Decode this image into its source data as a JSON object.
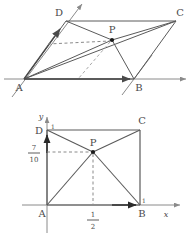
{
  "document": {
    "title": "Parallelogram and unit-square vector figures",
    "figure_count": 2
  },
  "upper_figure": {
    "name": "parallelogram-ABCD-with-interior-point-P",
    "shape": "parallelogram",
    "vertices": [
      {
        "id": "A",
        "label": "A",
        "x": 24,
        "y": 79
      },
      {
        "id": "B",
        "label": "B",
        "x": 134,
        "y": 79
      },
      {
        "id": "C",
        "label": "C",
        "x": 176,
        "y": 21
      },
      {
        "id": "D",
        "label": "D",
        "x": 66,
        "y": 21
      }
    ],
    "interior_point": {
      "id": "P",
      "label": "P",
      "x": 112,
      "y": 40
    },
    "axis_arrow_labels": [
      "A",
      "B"
    ],
    "vector_arrows": [
      {
        "name": "AB-vector-arrow",
        "from": "A",
        "to": "B"
      },
      {
        "name": "AD-vector-arrow",
        "from": "A",
        "to": "D"
      }
    ],
    "dashed_lines": [
      {
        "name": "horizontal-projection-dashed",
        "from": "AD-edge",
        "to": "P"
      },
      {
        "name": "oblique-projection-dashed",
        "from": "P",
        "to": "AB-edge"
      }
    ],
    "solid_segments": [
      "AB",
      "BC",
      "CD",
      "DA",
      "AP",
      "AC",
      "DP",
      "PB",
      "PC"
    ]
  },
  "lower_figure": {
    "name": "unit-square-ABCD-coordinate-plane",
    "shape": "square",
    "axes": {
      "x_label": "x",
      "y_label": "y",
      "origin_at": "A"
    },
    "vertices": [
      {
        "id": "A",
        "label": "A",
        "coord": [
          0,
          0
        ]
      },
      {
        "id": "B",
        "label": "B",
        "coord": [
          1,
          0
        ]
      },
      {
        "id": "C",
        "label": "C",
        "coord": [
          1,
          1
        ]
      },
      {
        "id": "D",
        "label": "D",
        "coord": [
          0,
          1
        ]
      }
    ],
    "interior_point": {
      "id": "P",
      "label": "P",
      "coord": [
        0.5,
        0.7
      ]
    },
    "tick_labels": [
      {
        "name": "y-tick-one",
        "text": "1",
        "axis": "y",
        "value": 1
      },
      {
        "name": "x-tick-one",
        "text": "1",
        "axis": "x",
        "value": 1
      }
    ],
    "fraction_labels": [
      {
        "name": "y-value-seven-tenths",
        "numerator": "7",
        "denominator": "10",
        "axis": "y",
        "value": 0.7
      },
      {
        "name": "x-value-one-half",
        "numerator": "1",
        "denominator": "2",
        "axis": "x",
        "value": 0.5
      }
    ],
    "dashed_lines": [
      {
        "name": "p-to-y-axis-dashed",
        "from": "P",
        "to": "y-axis"
      },
      {
        "name": "p-to-x-axis-dashed",
        "from": "P",
        "to": "x-axis"
      }
    ],
    "solid_segments": [
      "AB",
      "BC",
      "CD",
      "DA",
      "DP",
      "PC",
      "AP",
      "PB"
    ],
    "arrow_markers": [
      "y-axis-arrow-at-D",
      "x-axis-arrow-at-B",
      "x-axis-tip-arrow",
      "y-axis-tip-arrow"
    ]
  },
  "style": {
    "stroke": "#5a5a5a",
    "axis_stroke": "#8a8a8a",
    "dash_stroke": "#8a8a8a",
    "point_fill": "#1a1a1a",
    "text_color": "#4a4a4a",
    "background": "#ffffff"
  }
}
